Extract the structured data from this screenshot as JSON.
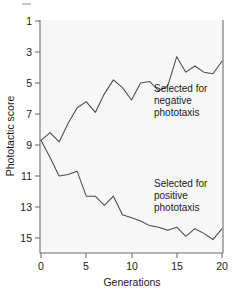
{
  "chart_data": {
    "type": "line",
    "title": "",
    "xlabel": "Generations",
    "ylabel": "Phototactic score",
    "x": [
      0,
      1,
      2,
      3,
      4,
      5,
      6,
      7,
      8,
      9,
      10,
      11,
      12,
      13,
      14,
      15,
      16,
      17,
      18,
      19,
      20
    ],
    "xlim": [
      0,
      20
    ],
    "ylim": [
      1,
      16
    ],
    "y_axis_inverted": true,
    "xticks": [
      0,
      5,
      10,
      15,
      20
    ],
    "xtick_labels": [
      "0",
      "5",
      "10",
      "15",
      "20"
    ],
    "yticks": [
      1,
      3,
      5,
      7,
      9,
      11,
      13,
      15
    ],
    "ytick_labels": [
      "1",
      "3",
      "5",
      "7",
      "9",
      "11",
      "13",
      "15"
    ],
    "grid": false,
    "legend_position": "inline-annotations",
    "series": [
      {
        "name": "Selected for negative phototaxis",
        "color": "#4a4a4a",
        "values": [
          8.7,
          8.2,
          8.8,
          7.6,
          6.6,
          6.2,
          6.9,
          5.7,
          4.8,
          5.3,
          6.1,
          5.0,
          4.9,
          5.5,
          5.2,
          3.3,
          4.3,
          3.9,
          4.3,
          4.4,
          3.6
        ]
      },
      {
        "name": "Selected for positive phototaxis",
        "color": "#4a4a4a",
        "values": [
          8.7,
          9.8,
          11.0,
          10.9,
          10.7,
          12.3,
          12.3,
          12.9,
          12.3,
          13.5,
          13.7,
          13.9,
          14.2,
          14.3,
          14.5,
          14.3,
          14.9,
          14.4,
          14.7,
          15.1,
          14.4
        ]
      }
    ],
    "annotations": [
      {
        "id": "annotation-negative",
        "lines": [
          "Selected for",
          "negative",
          "phototaxis"
        ],
        "x_px": 154,
        "y_px": 88
      },
      {
        "id": "annotation-positive",
        "lines": [
          "Selected for",
          "positive",
          "phototaxis"
        ],
        "x_px": 154,
        "y_px": 183
      }
    ]
  },
  "axes": {
    "x_title": "Generations",
    "y_title": "Phototactic score"
  }
}
